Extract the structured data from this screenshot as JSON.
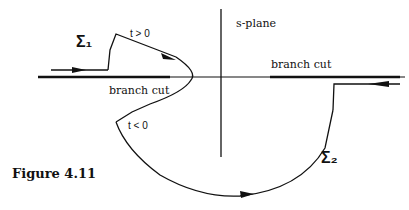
{
  "figure": {
    "caption": "Figure 4.11",
    "plane_label": "s-plane",
    "branch_cut_left_label": "branch cut",
    "branch_cut_right_label": "branch cut",
    "contour_1_label": "Σ₁",
    "contour_2_label": "Σ₂",
    "time_positive_label": "t > 0",
    "time_negative_label": "t < 0",
    "colors": {
      "ink": "#111111",
      "background": "#ffffff"
    }
  }
}
